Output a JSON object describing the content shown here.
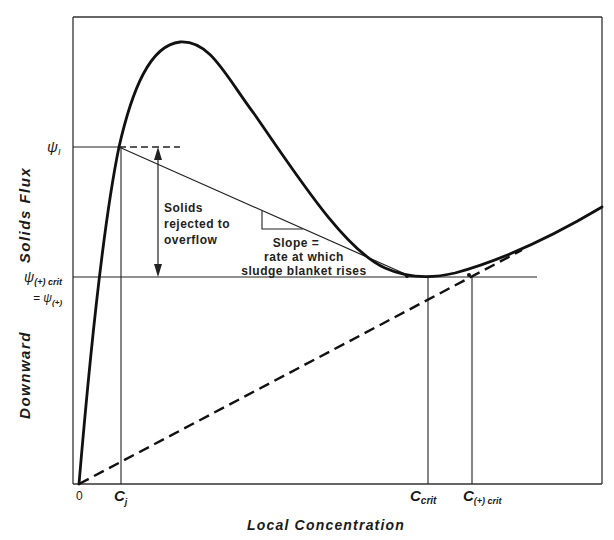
{
  "diagram": {
    "type": "solids-flux-curve",
    "y_axis_label_top": "Solids Flux",
    "y_axis_label_bottom": "Downward",
    "x_axis_label": "Local Concentration",
    "origin_label": "0",
    "y_ticks": {
      "psi_I": "ψ",
      "psi_I_sub": "I",
      "psi_crit": "ψ",
      "psi_crit_sub": "(+) crit",
      "psi_plus_eq": "= ψ",
      "psi_plus_sub": "(+)"
    },
    "x_ticks": {
      "c_j": "C",
      "c_j_sub": "j",
      "c_crit": "C",
      "c_crit_sub": "crit",
      "c_plus_crit": "C",
      "c_plus_crit_sub": "(+) crit"
    },
    "annotations": {
      "rejected_line1": "Solids",
      "rejected_line2": "rejected to",
      "rejected_line3": "overflow",
      "slope_line1": "Slope =",
      "slope_line2": "rate at which",
      "slope_line3": "sludge blanket rises"
    },
    "colors": {
      "ink": "#1a1a1a",
      "background": "#ffffff"
    }
  }
}
